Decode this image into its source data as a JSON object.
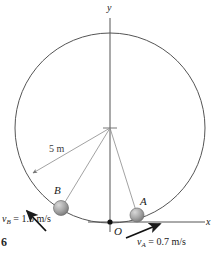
{
  "figure": {
    "type": "physics-diagram",
    "axes": {
      "y_label": "y",
      "x_label": "x",
      "origin_label": "O"
    },
    "circle": {
      "center_x": 110,
      "center_y": 128,
      "radius_px": 95,
      "radius_label": "5 m",
      "stroke": "#555555"
    },
    "points": [
      {
        "id": "A",
        "label": "A",
        "x": 137,
        "y": 215,
        "fill": "#9a9a9a"
      },
      {
        "id": "B",
        "label": "B",
        "x": 61,
        "y": 208,
        "fill": "#9a9a9a"
      }
    ],
    "velocities": [
      {
        "id": "vA",
        "symbol": "v",
        "subscript": "A",
        "equals": "=",
        "value": "0.7",
        "units": "m/s",
        "full_label": "vA = 0.7 m/s",
        "direction": "up-right"
      },
      {
        "id": "vB",
        "symbol": "v",
        "subscript": "B",
        "equals": "=",
        "value": "1.5",
        "units": "m/s",
        "full_label": "vB = 1.5 m/s",
        "direction": "up-left"
      }
    ],
    "page_number": "6",
    "colors": {
      "ink": "#1a1a1a",
      "line": "#555555",
      "leader": "#777777",
      "ball": "#9a9a9a",
      "background": "#ffffff"
    }
  }
}
